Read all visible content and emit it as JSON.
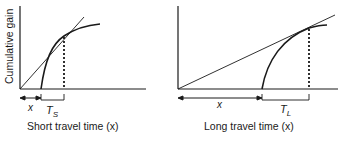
{
  "left_panel": {
    "ylabel": "Cumulative gain",
    "x_marker": "x",
    "t_marker": "T",
    "t_sub": "S",
    "caption": "Short travel time (x)"
  },
  "right_panel": {
    "x_marker": "x",
    "t_marker": "T",
    "t_sub": "L",
    "caption": "Long travel time (x)"
  },
  "colors": {
    "ink": "#1a1a1a",
    "background": "#ffffff"
  }
}
